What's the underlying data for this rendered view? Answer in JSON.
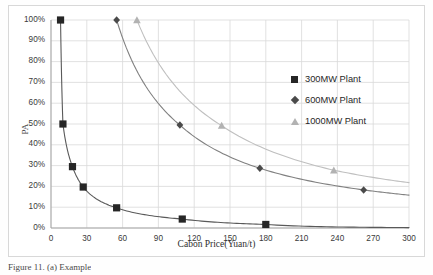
{
  "figure": {
    "caption": "Figure 11. (a) Example"
  },
  "chart_data": {
    "type": "line",
    "title": "",
    "xlabel": "Cabon Price(Yuan/t)",
    "ylabel": "PA",
    "xlim": [
      0,
      300
    ],
    "ylim": [
      0,
      1
    ],
    "grid": true,
    "legend_position": "right-inside",
    "xticks": [
      "0",
      "30",
      "60",
      "90",
      "120",
      "150",
      "180",
      "210",
      "240",
      "270",
      "300"
    ],
    "xtick_values": [
      0,
      30,
      60,
      90,
      120,
      150,
      180,
      210,
      240,
      270,
      300
    ],
    "yticks": [
      "0%",
      "10%",
      "20%",
      "30%",
      "40%",
      "50%",
      "60%",
      "70%",
      "80%",
      "90%",
      "100%"
    ],
    "ytick_values": [
      0,
      0.1,
      0.2,
      0.3,
      0.4,
      0.5,
      0.6,
      0.7,
      0.8,
      0.9,
      1.0
    ],
    "series": [
      {
        "name": "300MW Plant",
        "marker": "square",
        "color": "#262626",
        "line_color": "#595959",
        "points": [
          {
            "x": 8,
            "y": 1.0
          },
          {
            "x": 10,
            "y": 0.5
          },
          {
            "x": 18,
            "y": 0.295
          },
          {
            "x": 27,
            "y": 0.197
          },
          {
            "x": 55,
            "y": 0.097
          },
          {
            "x": 110,
            "y": 0.043
          },
          {
            "x": 180,
            "y": 0.017
          },
          {
            "x": 300,
            "y": 0.002
          }
        ]
      },
      {
        "name": "600MW Plant",
        "marker": "diamond",
        "color": "#4a4a4a",
        "line_color": "#808080",
        "points": [
          {
            "x": 55,
            "y": 1.0
          },
          {
            "x": 108,
            "y": 0.495
          },
          {
            "x": 175,
            "y": 0.287
          },
          {
            "x": 262,
            "y": 0.183
          },
          {
            "x": 300,
            "y": 0.158
          }
        ]
      },
      {
        "name": "1000MW Plant",
        "marker": "triangle",
        "color": "#b2b2b2",
        "line_color": "#bfbfbf",
        "points": [
          {
            "x": 72,
            "y": 1.0
          },
          {
            "x": 143,
            "y": 0.492
          },
          {
            "x": 237,
            "y": 0.278
          },
          {
            "x": 300,
            "y": 0.218
          }
        ]
      }
    ],
    "legend": [
      {
        "label": "300MW Plant",
        "marker": "square"
      },
      {
        "label": "600MW Plant",
        "marker": "diamond"
      },
      {
        "label": "1000MW Plant",
        "marker": "triangle"
      }
    ]
  }
}
